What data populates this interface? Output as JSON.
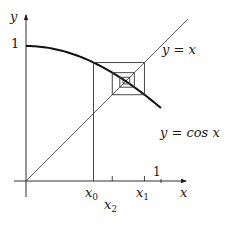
{
  "diagram": {
    "labels": {
      "y_axis": "y",
      "x_axis": "x",
      "y_tick_one": "1",
      "x_tick_one": "1",
      "x0": "x",
      "x0_sub": "0",
      "x1": "x",
      "x1_sub": "1",
      "x2": "x",
      "x2_sub": "2",
      "line_label": "y = x",
      "curve_label": "y = cos x"
    },
    "geometry": {
      "origin_px": [
        26,
        181
      ],
      "unit_px": 135,
      "x_start_value": 0.5,
      "iterations": 6
    },
    "colors": {
      "axis": "#1a1a1a",
      "curve": "#111111",
      "diagonal": "#333333",
      "cobweb": "#333333"
    }
  }
}
